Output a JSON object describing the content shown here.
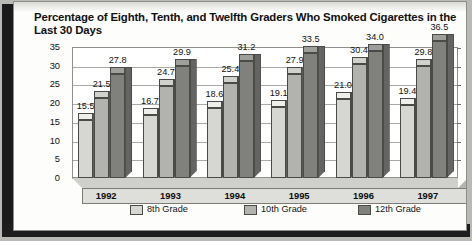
{
  "title": "Percentage of Eighth, Tenth, and Twelfth Graders Who Smoked Cigarettes in the Last 30 Days",
  "chart_data": {
    "type": "bar",
    "title": "Percentage of Eighth, Tenth, and Twelfth Graders Who Smoked Cigarettes in the Last 30 Days",
    "xlabel": "",
    "ylabel": "",
    "ylim": [
      0,
      35
    ],
    "yticks": [
      "0",
      "5",
      "10",
      "15",
      "20",
      "25",
      "30",
      "35"
    ],
    "grid": true,
    "legend_position": "bottom",
    "style": "3d-clustered-column",
    "categories": [
      "1992",
      "1993",
      "1994",
      "1995",
      "1996",
      "1997"
    ],
    "series": [
      {
        "name": "8th Grade",
        "color": "#d6d6d2",
        "top_color": "#eeeeea",
        "side_color": "#b5b5b1",
        "values": [
          15.5,
          16.7,
          18.6,
          19.1,
          21.0,
          19.4
        ],
        "labels": [
          "15.5",
          "16.7",
          "18.6",
          "19.1",
          "21.0",
          "19.4"
        ]
      },
      {
        "name": "10th Grade",
        "color": "#b2b2ae",
        "top_color": "#d0d0cc",
        "side_color": "#939390",
        "values": [
          21.5,
          24.7,
          25.4,
          27.9,
          30.4,
          29.8
        ],
        "labels": [
          "21.5",
          "24.7",
          "25.4",
          "27.9",
          "30.4",
          "29.8"
        ]
      },
      {
        "name": "12th Grade",
        "color": "#80807d",
        "top_color": "#9e9e9b",
        "side_color": "#646462",
        "values": [
          27.8,
          29.9,
          31.2,
          33.5,
          34.0,
          36.5
        ],
        "labels": [
          "27.8",
          "29.9",
          "31.2",
          "33.5",
          "34.0",
          "36.5"
        ]
      }
    ]
  },
  "legend": [
    {
      "label": "8th Grade"
    },
    {
      "label": "10th Grade"
    },
    {
      "label": "12th Grade"
    }
  ]
}
